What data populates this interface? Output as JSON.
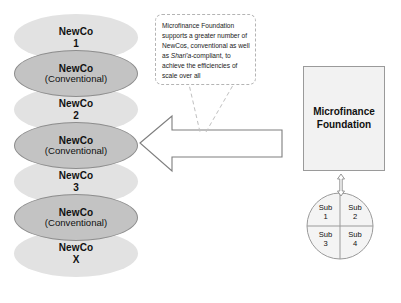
{
  "diagram": {
    "colors": {
      "ellipse_light": "#e2e2e2",
      "ellipse_dark": "#c3c3c3",
      "ellipse_dark_stroke": "#8d8d8d",
      "box_fill": "#f2f2f2",
      "box_stroke": "#9a9a9a",
      "outline": "#8a8a8a",
      "callout_stroke": "#b4b4b4",
      "background": "#ffffff",
      "text": "#111111"
    }
  },
  "newco_stack": [
    {
      "line1": "NewCo",
      "line2": "1",
      "variant": "light"
    },
    {
      "line1": "NewCo",
      "line2": "(Conventional)",
      "variant": "dark"
    },
    {
      "line1": "NewCo",
      "line2": "2",
      "variant": "light"
    },
    {
      "line1": "NewCo",
      "line2": "(Conventional)",
      "variant": "dark"
    },
    {
      "line1": "NewCo",
      "line2": "3",
      "variant": "light"
    },
    {
      "line1": "NewCo",
      "line2": "(Conventional)",
      "variant": "dark"
    },
    {
      "line1": "NewCo",
      "line2": "X",
      "variant": "light"
    }
  ],
  "callout": {
    "text_before_italic": "Microfinance Foundation supports a greater number of NewCos, conventional as well as ",
    "italic_term": "Shari'a",
    "text_after_italic": "-compliant, to achieve the efficiencies of scale over all",
    "full_text": "Microfinance Foundation supports a greater number of NewCos, conventional as well as Shari'a-compliant, to achieve the efficiencies of scale over all"
  },
  "foundation": {
    "label": "Microfinance\nFoundation"
  },
  "subsidiaries": {
    "quadrants": [
      {
        "line1": "Sub",
        "line2": "1",
        "position": "top-left"
      },
      {
        "line1": "Sub",
        "line2": "2",
        "position": "top-right"
      },
      {
        "line1": "Sub",
        "line2": "3",
        "position": "bottom-left"
      },
      {
        "line1": "Sub",
        "line2": "4",
        "position": "bottom-right"
      }
    ]
  },
  "connectors": {
    "big_arrow_direction": "left",
    "vertical_arrow_direction": "bidirectional"
  }
}
